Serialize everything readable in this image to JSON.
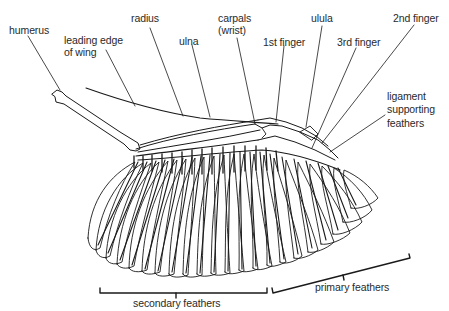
{
  "diagram": {
    "colors": {
      "ink": "#1a1a1a",
      "label_text": "#2a2a2a",
      "background": "#ffffff"
    },
    "labels": {
      "humerus": "humerus",
      "leading_edge_1": "leading edge",
      "leading_edge_2": "of wing",
      "radius": "radius",
      "ulna": "ulna",
      "carpals_1": "carpals",
      "carpals_2": "(wrist)",
      "first_finger": "1st finger",
      "ulula": "ulula",
      "third_finger": "3rd finger",
      "second_finger": "2nd finger",
      "ligament_1": "ligament",
      "ligament_2": "supporting",
      "ligament_3": "feathers",
      "secondary_feathers": "secondary feathers",
      "primary_feathers": "primary feathers"
    }
  }
}
